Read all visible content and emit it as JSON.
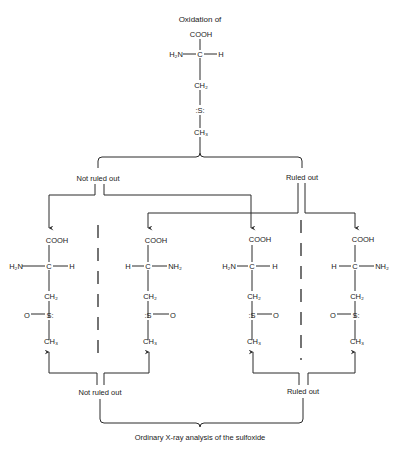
{
  "title": "Oxidation of",
  "caption": "Ordinary X-ray analysis of the sulfoxide",
  "top_branch": {
    "left_label": "Not ruled out",
    "right_label": "Ruled out"
  },
  "bottom_branch": {
    "left_label": "Not ruled out",
    "right_label": "Ruled out"
  },
  "top_molecule": {
    "carboxyl": "COOH",
    "left": "H₂N",
    "center": "C",
    "right": "H",
    "ch2": "CH₂",
    "sulfur": ":S:",
    "ch3": "CH₃"
  },
  "molecules": [
    {
      "carboxyl": "COOH",
      "left": "H₂N",
      "center": "C",
      "right": "H",
      "ch2": "CH₂",
      "s_left": "O",
      "sulfur": "S:",
      "s_right": "",
      "ch3": "CH₃"
    },
    {
      "carboxyl": "COOH",
      "left": "H",
      "center": "C",
      "right": "NH₂",
      "ch2": "CH₂",
      "s_left": "",
      "sulfur": ":S",
      "s_right": "O",
      "ch3": "CH₃"
    },
    {
      "carboxyl": "COOH",
      "left": "H₂N",
      "center": "C",
      "right": "H",
      "ch2": "CH₂",
      "s_left": "",
      "sulfur": ":S",
      "s_right": "O",
      "ch3": "CH₃"
    },
    {
      "carboxyl": "COOH",
      "left": "H",
      "center": "C",
      "right": "NH₂",
      "ch2": "CH₂",
      "s_left": "O",
      "sulfur": "S:",
      "s_right": "",
      "ch3": "CH₃"
    }
  ],
  "colors": {
    "line": "#2a2a2a",
    "text": "#1a1a1a",
    "background": "#ffffff"
  }
}
